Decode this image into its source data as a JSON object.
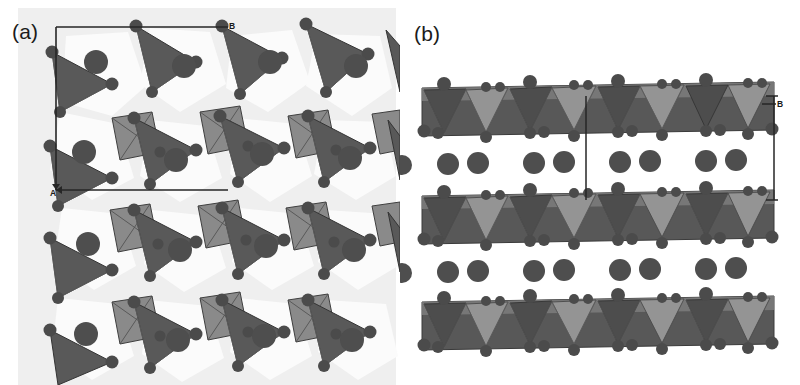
{
  "figure": {
    "kind": "crystal-structure-figure",
    "background": "#ffffff",
    "width": 800,
    "height": 385
  },
  "panels": [
    {
      "id": "a",
      "label": "(a)",
      "view": "projection down the c-axis showing the tetrahedral-octahedral sheet",
      "axes": [
        {
          "name": "B",
          "label": "B",
          "direction": "horizontal-right"
        },
        {
          "name": "A",
          "label": "A",
          "direction": "vertical-down"
        }
      ],
      "unit_cell": {
        "shown": true,
        "shape": "rectangle"
      }
    },
    {
      "id": "b",
      "label": "(b)",
      "view": "side view showing stacked layers with interlayer cations",
      "axes": [
        {
          "name": "B",
          "label": "B",
          "direction": "vertical"
        }
      ],
      "unit_cell": {
        "shown": true,
        "shape": "bracket"
      },
      "layer_count": 3
    }
  ],
  "legend_colors": {
    "tetrahedron_dark": "#595959",
    "tetrahedron_light": "#8f8f8f",
    "octahedron_mid": "#8a8a8a",
    "polyhedron_edge": "#3a3a3a",
    "atom_fill": "#4e4e4e",
    "sheet_background": "#efefef",
    "void_fill": "#fbfbfb",
    "cell_line": "#2b2b2b",
    "page_background": "#ffffff"
  },
  "structure_a": {
    "type": "polyhedral-network",
    "tetrahedra_count": 18,
    "octahedra_count": 8,
    "cations_count": 16
  },
  "structure_b": {
    "type": "layer-stack",
    "layers": 3,
    "interlayer_cation_rows": 2,
    "cations_per_row": 8
  }
}
